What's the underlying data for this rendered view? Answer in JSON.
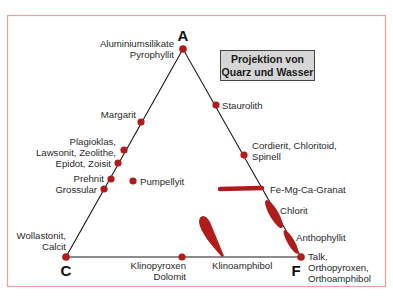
{
  "colors": {
    "frame": "#e8a0a0",
    "line": "#1a1a1a",
    "point": "#b01c1c",
    "box_fill": "#d6d6d6",
    "box_border": "#444444"
  },
  "title_box": {
    "line1": "Projektion von",
    "line2": "Quarz und Wasser"
  },
  "corners": {
    "A": "A",
    "C": "C",
    "F": "F"
  },
  "labels": {
    "aluminiumsilikate": "Aluminiumsilikate",
    "pyrophyllit": "Pyrophyllit",
    "margarit": "Margarit",
    "plagioklas": "Plagioklas,",
    "lawsonit": "Lawsonit, Zeolithe,",
    "epidot": "Epidot, Zoisit",
    "prehnit": "Prehnit",
    "grossular": "Grossular",
    "pumpellyit": "Pumpellyit",
    "wollastonit": "Wollastonit,",
    "calcit": "Calcit",
    "staurolith": "Staurolith",
    "cordierit": "Cordierit, Chloritoid,",
    "spinell": "Spinell",
    "granat": "Fe-Mg-Ca-Granat",
    "chlorit": "Chlorit",
    "anthophyllit": "Anthophyllit",
    "talk": "Talk,",
    "orthopyroxen": "Orthopyroxen,",
    "orthoamphibol": "Orthoamphibol",
    "klinopyroxen": "Klinopyroxen",
    "dolomit": "Dolomit",
    "klinoamphibol": "Klinoamphibol"
  }
}
